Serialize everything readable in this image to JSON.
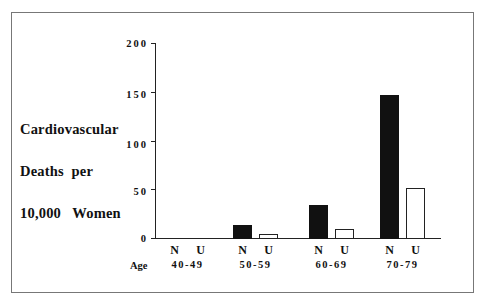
{
  "chart_data": {
    "type": "bar",
    "title": "",
    "ylabel_lines": [
      "Cardiovascular",
      "Deaths  per",
      "10,000   Women"
    ],
    "ylabel": "Cardiovascular Deaths per 10,000 Women",
    "xlabel": "Age",
    "ylim": [
      0,
      200
    ],
    "yticks": [
      0,
      50,
      100,
      150,
      200
    ],
    "grid": false,
    "legend": null,
    "categories": [
      "40-49",
      "50-59",
      "60-69",
      "70-79"
    ],
    "sub_labels": [
      "N",
      "U"
    ],
    "series": [
      {
        "name": "N",
        "color": "#111111",
        "values": [
          0,
          13,
          34,
          147
        ]
      },
      {
        "name": "U",
        "color": "#ffffff",
        "values": [
          0,
          4,
          9,
          51
        ]
      }
    ]
  },
  "axis": {
    "ticks": [
      "0",
      "50",
      "100",
      "150",
      "200"
    ],
    "age_label": "Age"
  }
}
